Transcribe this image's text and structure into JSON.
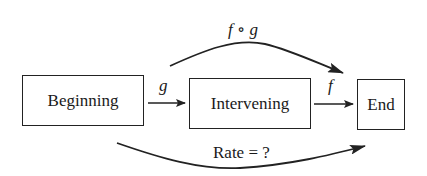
{
  "diagram": {
    "nodes": [
      {
        "id": "beginning",
        "label": "Beginning"
      },
      {
        "id": "intervening",
        "label": "Intervening"
      },
      {
        "id": "end",
        "label": "End"
      }
    ],
    "edges": [
      {
        "from": "beginning",
        "to": "intervening",
        "label": "g"
      },
      {
        "from": "intervening",
        "to": "end",
        "label": "f"
      },
      {
        "from": "beginning",
        "to": "end",
        "label": "f ∘ g",
        "style": "curved-top"
      },
      {
        "from": "beginning",
        "to": "end",
        "label": "Rate = ?",
        "style": "curved-bottom"
      }
    ],
    "colors": {
      "stroke": "#222222",
      "text": "#1a1a1a",
      "background": "#ffffff"
    }
  }
}
